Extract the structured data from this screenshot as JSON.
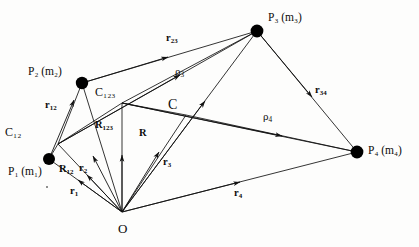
{
  "figure": {
    "type": "vector-diagram",
    "background_color": "#fdfdfc",
    "stroke_color": "#111111",
    "node_color": "#000000"
  },
  "particles": [
    {
      "id": "P1",
      "label_main": "P",
      "label_sub": "1",
      "mass_main": "m",
      "mass_sub": "1",
      "text": "P₁ (m₁)",
      "x": 49,
      "y": 159
    },
    {
      "id": "P2",
      "label_main": "P",
      "label_sub": "2",
      "mass_main": "m",
      "mass_sub": "2",
      "text": "P₂ (m₂)",
      "x": 82,
      "y": 83
    },
    {
      "id": "P3",
      "label_main": "P",
      "label_sub": "3",
      "mass_main": "m",
      "mass_sub": "3",
      "text": "P₃ (m₃)",
      "x": 257,
      "y": 31
    },
    {
      "id": "P4",
      "label_main": "P",
      "label_sub": "4",
      "mass_main": "m",
      "mass_sub": "4",
      "text": "P₄ (m₄)",
      "x": 357,
      "y": 152
    }
  ],
  "origin": {
    "id": "O",
    "label": "O",
    "x": 122,
    "y": 212
  },
  "centres": [
    {
      "id": "C12",
      "label_main": "C",
      "label_sub": "12",
      "text": "C₁₂",
      "x": 58,
      "y": 144
    },
    {
      "id": "C123",
      "label_main": "C",
      "label_sub": "123",
      "text": "C₁₂₃",
      "x": 122,
      "y": 103
    },
    {
      "id": "C",
      "label_main": "C",
      "label_sub": "",
      "text": "C",
      "x": 186,
      "y": 115
    }
  ],
  "vectors": [
    {
      "name": "r1",
      "main": "r",
      "sub": "1",
      "style": "bold",
      "from": "O",
      "to": "P1",
      "label_x": 76,
      "label_y": 190
    },
    {
      "name": "r2",
      "main": "r",
      "sub": "2",
      "style": "bold",
      "from": "O",
      "to": "P2",
      "label_x": 87,
      "label_y": 168
    },
    {
      "name": "r3",
      "main": "r",
      "sub": "3",
      "style": "bold",
      "from": "O",
      "to": "P3",
      "label_x": 168,
      "label_y": 162
    },
    {
      "name": "r4",
      "main": "r",
      "sub": "4",
      "style": "bold",
      "from": "O",
      "to": "P4",
      "label_x": 239,
      "label_y": 193
    },
    {
      "name": "R12",
      "main": "R",
      "sub": "12",
      "style": "bold",
      "from": "O",
      "to": "C12",
      "label_x": 66,
      "label_y": 170
    },
    {
      "name": "R123",
      "main": "R",
      "sub": "123",
      "style": "bold",
      "from": "O",
      "to": "C123",
      "label_x": 103,
      "label_y": 127
    },
    {
      "name": "R",
      "main": "R",
      "sub": "",
      "style": "bold",
      "from": "O",
      "to": "C",
      "label_x": 142,
      "label_y": 135
    },
    {
      "name": "r12",
      "main": "r",
      "sub": "12",
      "style": "bold",
      "from": "P1",
      "to": "P2",
      "label_x": 52,
      "label_y": 106
    },
    {
      "name": "r23",
      "main": "r",
      "sub": "23",
      "style": "bold",
      "from": "P2",
      "to": "P3",
      "label_x": 172,
      "label_y": 38
    },
    {
      "name": "r34",
      "main": "r",
      "sub": "34",
      "style": "bold",
      "from": "P3",
      "to": "P4",
      "label_x": 320,
      "label_y": 90
    },
    {
      "name": "rho3",
      "main": "ρ",
      "sub": "3",
      "style": "greek",
      "from": "C12",
      "to": "P3",
      "label_x": 180,
      "label_y": 72
    },
    {
      "name": "rho4",
      "main": "ρ",
      "sub": "4",
      "style": "greek",
      "from": "C123",
      "to": "P4",
      "label_x": 268,
      "label_y": 117
    }
  ],
  "plain_segments": [
    {
      "name": "seg-C12-P2",
      "from": "C12",
      "to": "P2"
    },
    {
      "name": "seg-C12-P1",
      "from": "C12",
      "to": "P1"
    },
    {
      "name": "seg-C123-P3",
      "from": "C123",
      "to": "P3"
    },
    {
      "name": "seg-C123-C12",
      "from": "C123",
      "to": "C12"
    },
    {
      "name": "seg-C-C123",
      "from": "C",
      "to": "C123"
    },
    {
      "name": "seg-C-P4",
      "from": "C",
      "to": "P4"
    },
    {
      "name": "seg-P2-P3",
      "from": "P2",
      "to": "P3"
    },
    {
      "name": "seg-P3-P4",
      "from": "P3",
      "to": "P4"
    }
  ]
}
